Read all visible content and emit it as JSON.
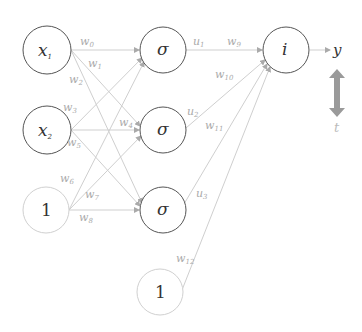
{
  "diagram": {
    "title": "",
    "nodes": {
      "x1": {
        "label": "x",
        "sub": "1"
      },
      "x2": {
        "label": "x",
        "sub": "2"
      },
      "bias_in": {
        "label": "1"
      },
      "h1": {
        "label": "σ"
      },
      "h2": {
        "label": "σ"
      },
      "h3": {
        "label": "σ"
      },
      "bias_hidden": {
        "label": "1"
      },
      "out": {
        "label": "i"
      }
    },
    "weights": {
      "w0": {
        "label": "w",
        "sub": "0"
      },
      "w1": {
        "label": "w",
        "sub": "1"
      },
      "w2": {
        "label": "w",
        "sub": "2"
      },
      "w3": {
        "label": "w",
        "sub": "3"
      },
      "w4": {
        "label": "w",
        "sub": "4"
      },
      "w5": {
        "label": "w",
        "sub": "5"
      },
      "w6": {
        "label": "w",
        "sub": "6"
      },
      "w7": {
        "label": "w",
        "sub": "7"
      },
      "w8": {
        "label": "w",
        "sub": "8"
      },
      "w9": {
        "label": "w",
        "sub": "9"
      },
      "w10": {
        "label": "w",
        "sub": "10"
      },
      "w11": {
        "label": "w",
        "sub": "11"
      },
      "w12": {
        "label": "w",
        "sub": "12"
      }
    },
    "hidden_outputs": {
      "u1": {
        "label": "u",
        "sub": "1"
      },
      "u2": {
        "label": "u",
        "sub": "2"
      },
      "u3": {
        "label": "u",
        "sub": "3"
      }
    },
    "output_label": "y",
    "target_label": "t",
    "colors": {
      "node_stroke": "#555555",
      "bias_stroke": "#cccccc",
      "edge": "#c8c8c8",
      "label_light": "#aaaaaa",
      "compare_arrow": "#999999"
    }
  }
}
